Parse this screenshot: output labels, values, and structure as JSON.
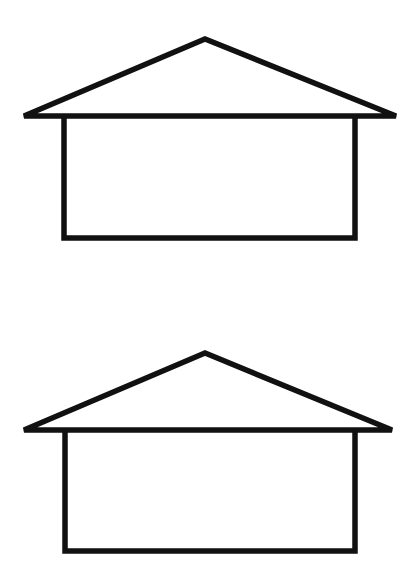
{
  "canvas": {
    "width": 412,
    "height": 572,
    "background_color": "#ffffff",
    "stroke_color": "#111111"
  },
  "figure": {
    "shape_count": 2
  },
  "shapes": [
    {
      "id": "house-top",
      "label": "Top house outline",
      "stroke_width": 5.5,
      "roof": {
        "left_eave_x": 24,
        "left_eave_y": 116,
        "apex_x": 205,
        "apex_y": 39,
        "right_eave_x": 396,
        "right_eave_y": 116
      },
      "body": {
        "left_wall_x": 64,
        "right_wall_x": 355,
        "top_y": 116,
        "bottom_y": 238
      },
      "roof_path": "M 24 116 L 205 39 L 396 116 Z",
      "body_path": "M 64 116 L 64 238 L 355 238 L 355 116"
    },
    {
      "id": "house-bottom",
      "label": "Bottom house outline",
      "stroke_width": 5.5,
      "roof": {
        "left_eave_x": 24,
        "left_eave_y": 430,
        "apex_x": 205,
        "apex_y": 353,
        "right_eave_x": 392,
        "right_eave_y": 430
      },
      "body": {
        "left_wall_x": 65,
        "right_wall_x": 355,
        "top_y": 430,
        "bottom_y": 551
      },
      "roof_path": "M 24 430 L 205 353 L 392 430 Z",
      "body_path": "M 65 430 L 65 551 L 355 551 L 355 430"
    }
  ]
}
